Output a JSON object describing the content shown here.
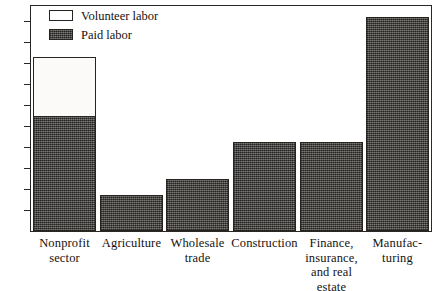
{
  "chart_data": {
    "type": "bar",
    "title": "",
    "subtitle": "",
    "xlabel": "",
    "ylabel": "",
    "ylim": [
      0,
      22
    ],
    "grid": false,
    "stacked": true,
    "legend_position": "top-left",
    "yticks": [
      2,
      4,
      6,
      8,
      10,
      12,
      14,
      16,
      18,
      20
    ],
    "ytick_labels": [
      "2",
      "4",
      "6",
      "8",
      "10",
      "12",
      "14",
      "16",
      "18",
      "20"
    ],
    "categories": [
      "Nonprofit sector",
      "Agriculture",
      "Wholesale trade",
      "Construction",
      "Finance, insurance, and real estate",
      "Manufacturing"
    ],
    "category_label_lines": [
      [
        "Nonprofit",
        "sector"
      ],
      [
        "Agriculture"
      ],
      [
        "Wholesale",
        "trade"
      ],
      [
        "Construction"
      ],
      [
        "Finance,",
        "insurance,",
        "and real",
        "estate"
      ],
      [
        "Manufac-",
        "turing"
      ]
    ],
    "series": [
      {
        "name": "Paid labor",
        "color": "#4a4744",
        "values": [
          11.0,
          3.4,
          5.0,
          8.5,
          8.5,
          20.4
        ]
      },
      {
        "name": "Volunteer labor",
        "color": "#ffffff",
        "values": [
          5.6,
          0,
          0,
          0,
          0,
          0
        ]
      }
    ],
    "totals": [
      16.6,
      3.4,
      5.0,
      8.5,
      8.5,
      20.4
    ]
  },
  "legend": {
    "items": [
      {
        "label": "Volunteer labor",
        "swatch": "volunteer-swatch"
      },
      {
        "label": "Paid labor",
        "swatch": "paid-swatch"
      }
    ]
  },
  "axis": {
    "ytick_labels": [
      "20",
      "18",
      "16",
      "14",
      "12",
      "10",
      "8",
      "6",
      "4",
      "2"
    ]
  },
  "xlabels": [
    {
      "line1": "Nonprofit",
      "line2": "sector",
      "line3": "",
      "line4": ""
    },
    {
      "line1": "Agriculture",
      "line2": "",
      "line3": "",
      "line4": ""
    },
    {
      "line1": "Wholesale",
      "line2": "trade",
      "line3": "",
      "line4": ""
    },
    {
      "line1": "Construction",
      "line2": "",
      "line3": "",
      "line4": ""
    },
    {
      "line1": "Finance,",
      "line2": "insurance,",
      "line3": "and real",
      "line4": "estate"
    },
    {
      "line1": "Manufac-",
      "line2": "turing",
      "line3": "",
      "line4": ""
    }
  ]
}
